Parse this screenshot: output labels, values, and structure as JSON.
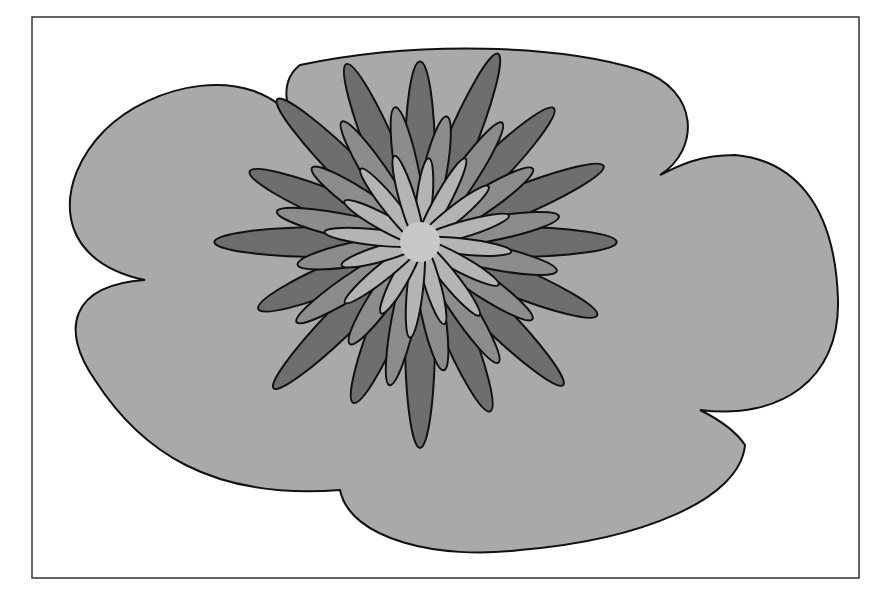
{
  "figure": {
    "frame": {
      "x": 32,
      "y": 17,
      "width": 827,
      "height": 561
    },
    "colors": {
      "background": "#ffffff",
      "blob_fill": "#a9a9a9",
      "outline": "#111111",
      "petal_outer": "#6e6e6e",
      "petal_middle": "#8c8c8c",
      "petal_inner": "#b4b4b4",
      "center": "#c8c8c8"
    },
    "blob": {
      "description": "Large irregular scalloped gray blob with six lobes",
      "lobes": 6
    },
    "flower": {
      "center": {
        "x": 420,
        "y": 242
      },
      "layers": [
        {
          "name": "outer",
          "count": 16,
          "length": 225,
          "width": 30,
          "rotation_offset": -90
        },
        {
          "name": "middle",
          "count": 16,
          "length": 160,
          "width": 24,
          "rotation_offset": -78
        },
        {
          "name": "inner",
          "count": 16,
          "length": 105,
          "width": 16,
          "rotation_offset": -84
        }
      ],
      "center_radius": 20
    }
  }
}
